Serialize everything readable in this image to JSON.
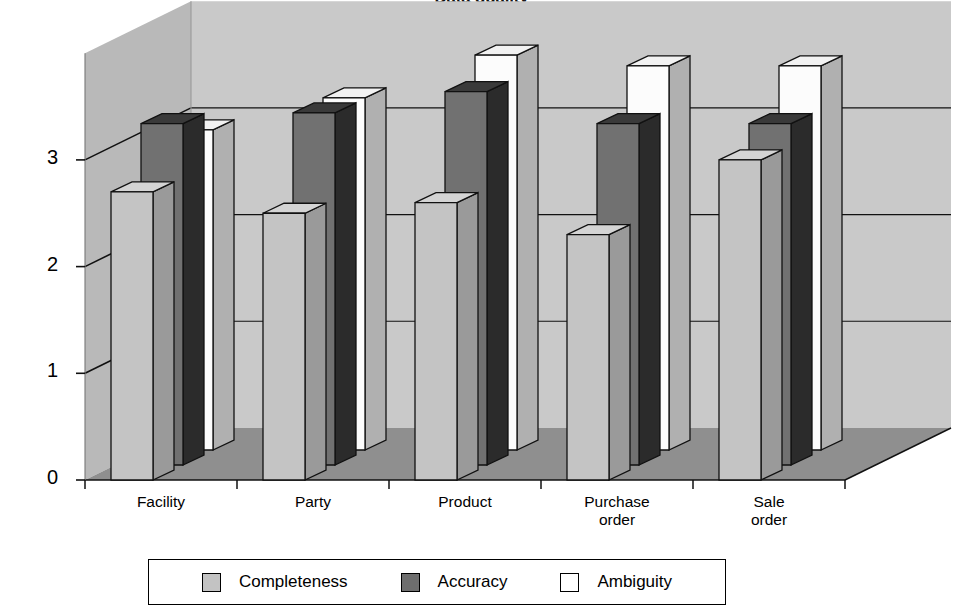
{
  "chart_data": {
    "type": "bar",
    "title": "Data quality",
    "subtitle": "4—Good, 3—Some issues, 2—Data causes problems, 1—Data inadequate to use",
    "xlabel": "",
    "ylabel": "",
    "ylim": [
      0,
      4
    ],
    "yticks": [
      0,
      1,
      2,
      3
    ],
    "grid": true,
    "three_d": true,
    "legend_position": "bottom",
    "categories": [
      "Facility",
      "Party",
      "Product",
      "Purchase order",
      "Sale order"
    ],
    "series": [
      {
        "name": "Completeness",
        "color": "#c3c3c3",
        "values": [
          2.7,
          2.5,
          2.6,
          2.3,
          3.0
        ]
      },
      {
        "name": "Accuracy",
        "color": "#6e6e6e",
        "values": [
          3.2,
          3.3,
          3.5,
          3.2,
          3.2
        ]
      },
      {
        "name": "Ambiguity",
        "color": "#fbfbfb",
        "values": [
          3.0,
          3.3,
          3.7,
          3.6,
          3.6
        ]
      }
    ]
  },
  "axis": {
    "y_tick_labels": [
      "3",
      "2",
      "1",
      "0"
    ],
    "x_tick_labels": [
      "Facility",
      "Party",
      "Product",
      "Purchase\norder",
      "Sale\norder"
    ],
    "x_tick_line1": [
      "Facility",
      "Party",
      "Product",
      "Purchase",
      "Sale"
    ],
    "x_tick_line2": [
      "",
      "",
      "",
      "order",
      "order"
    ]
  },
  "legend": {
    "items": [
      {
        "label": "Completeness",
        "swatch": "#c3c3c3",
        "icon": "legend-swatch-completeness"
      },
      {
        "label": "Accuracy",
        "swatch": "#6e6e6e",
        "icon": "legend-swatch-accuracy"
      },
      {
        "label": "Ambiguity",
        "swatch": "#ffffff",
        "icon": "legend-swatch-ambiguity"
      }
    ]
  },
  "colors": {
    "floor": "#8f8f8f",
    "back_wall": "#c9c9c9",
    "side_wall": "#b9b9b9",
    "outline": "#111111",
    "completeness_front": "#c4c4c4",
    "completeness_side": "#9a9a9a",
    "completeness_top": "#d4d4d4",
    "accuracy_front": "#717171",
    "accuracy_side": "#2b2b2b",
    "accuracy_top": "#3a3a3a",
    "ambiguity_front": "#fcfcfc",
    "ambiguity_side": "#b0b0b0",
    "ambiguity_top": "#f2f2f2"
  }
}
